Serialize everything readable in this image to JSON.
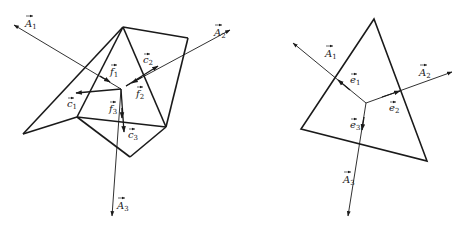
{
  "figure": {
    "left": {
      "title": "Polyhedral cell with face area vectors and edge vectors",
      "labels": {
        "A1": {
          "base": "A",
          "sub": "1"
        },
        "A2": {
          "base": "A",
          "sub": "2"
        },
        "A3": {
          "base": "A",
          "sub": "3"
        },
        "c1": {
          "base": "c",
          "sub": "1"
        },
        "c2": {
          "base": "c",
          "sub": "2"
        },
        "c3": {
          "base": "c",
          "sub": "3"
        },
        "f1": {
          "base": "f",
          "sub": "1"
        },
        "f2": {
          "base": "f",
          "sub": "2"
        },
        "f3": {
          "base": "f",
          "sub": "3"
        }
      }
    },
    "right": {
      "title": "Triangle cell with face area vectors and unit edge vectors",
      "labels": {
        "A1": {
          "base": "A",
          "sub": "1"
        },
        "A2": {
          "base": "A",
          "sub": "2"
        },
        "A3": {
          "base": "A",
          "sub": "3"
        },
        "e1": {
          "base": "e",
          "sub": "1"
        },
        "e2": {
          "base": "e",
          "sub": "2"
        },
        "e3": {
          "base": "e",
          "sub": "3"
        }
      }
    }
  },
  "colors": {
    "stroke": "#1a1a1a",
    "background": "#ffffff"
  }
}
